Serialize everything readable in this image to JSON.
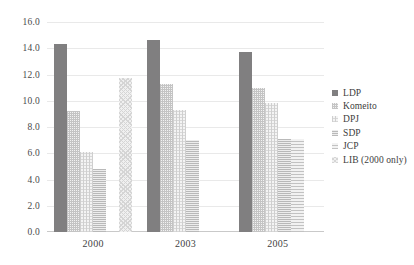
{
  "chart_data": {
    "type": "bar",
    "title": "",
    "subtitle": "",
    "xlabel": "",
    "ylabel": "",
    "categories": [
      "2000",
      "2003",
      "2005"
    ],
    "ylim": [
      0.0,
      16.0
    ],
    "ytick_step": 2.0,
    "ytick_labels": [
      "16.0",
      "14.0",
      "12.0",
      "10.0",
      "8.0",
      "6.0",
      "4.0",
      "2.0",
      "0.0"
    ],
    "ytick_values": [
      16.0,
      14.0,
      12.0,
      10.0,
      8.0,
      6.0,
      4.0,
      2.0,
      0.0
    ],
    "grid": true,
    "grid_axis": "y",
    "legend_position": "right",
    "series": [
      {
        "name": "LDP",
        "color": "#807f80",
        "pattern": "solid",
        "values": [
          14.3,
          14.6,
          13.7
        ]
      },
      {
        "name": "Komeito",
        "color": "#c4c4c4",
        "pattern": "fine-grid",
        "values": [
          9.2,
          11.3,
          11.0
        ]
      },
      {
        "name": "DPJ",
        "color": "#cfcfcf",
        "pattern": "cross-dot",
        "values": [
          6.1,
          9.3,
          9.8
        ]
      },
      {
        "name": "SDP",
        "color": "#b9b9b9",
        "pattern": "horizontal",
        "values": [
          4.8,
          7.0,
          7.1
        ]
      },
      {
        "name": "JCP",
        "color": "#c2c2c2",
        "pattern": "sparse-lines",
        "values": [
          0.0,
          0.0,
          7.1
        ]
      },
      {
        "name": "LIB (2000 only)",
        "color": "#d5d5d5",
        "pattern": "diagonal-mesh",
        "values": [
          11.7,
          0.0,
          0.0
        ]
      }
    ],
    "legend_entries": [
      "LDP",
      "Komeito",
      "DPJ",
      "SDP",
      "JCP",
      "LIB (2000 only)"
    ]
  }
}
